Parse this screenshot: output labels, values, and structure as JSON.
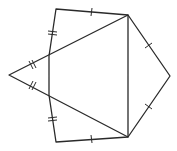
{
  "diagram": {
    "colors": {
      "stroke": "#2a2a2a",
      "background": "#ffffff"
    },
    "vertices": {
      "A_left_apex": [
        9,
        75
      ],
      "B_top_left": [
        56,
        9
      ],
      "C_top_right": [
        128,
        15
      ],
      "D_right_apex": [
        170,
        76
      ],
      "E_bottom_right": [
        128,
        137
      ],
      "F_bottom_left": [
        56,
        142
      ],
      "G_upper_left_mid": [
        49,
        56
      ],
      "H_lower_left_mid": [
        49,
        95
      ]
    },
    "tick_marks": {
      "single": [
        "B-C",
        "F-E",
        "C-D",
        "D-E"
      ],
      "double": [
        "G-B",
        "H-F",
        "A-G",
        "A-H"
      ]
    }
  }
}
